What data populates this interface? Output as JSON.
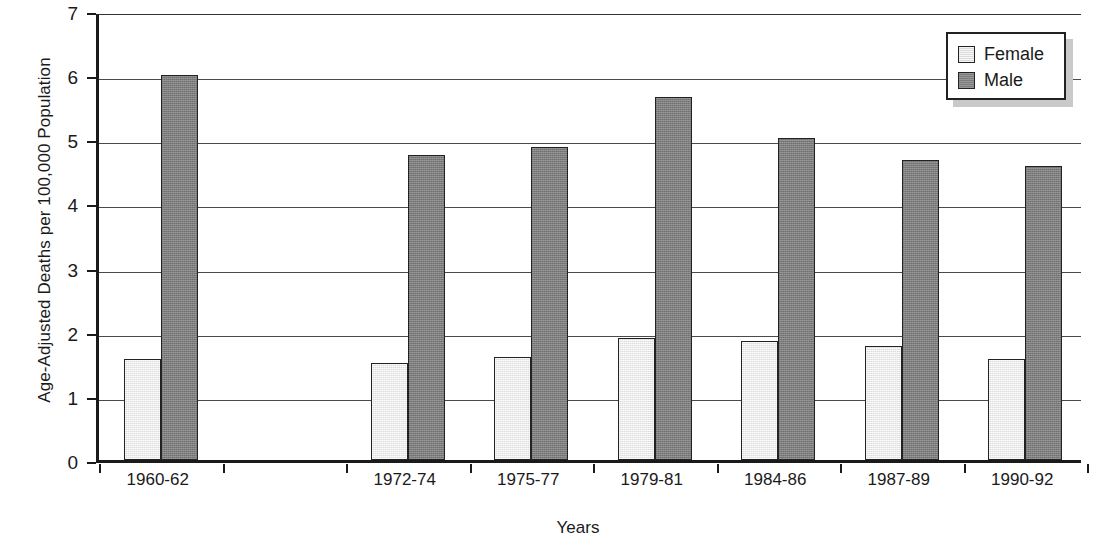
{
  "chart_data": {
    "type": "bar",
    "title": "",
    "xlabel": "Years",
    "ylabel": "Age-Adjusted Deaths per 100,000 Population",
    "categories": [
      "1960-62",
      "1972-74",
      "1975-77",
      "1979-81",
      "1984-86",
      "1987-89",
      "1990-92"
    ],
    "series": [
      {
        "name": "Female",
        "color": "#dcdcdc",
        "values": [
          1.58,
          1.51,
          1.6,
          1.9,
          1.85,
          1.78,
          1.57
        ]
      },
      {
        "name": "Male",
        "color": "#7d7d7d",
        "values": [
          6.0,
          4.76,
          4.88,
          5.66,
          5.02,
          4.67,
          4.58
        ]
      }
    ],
    "ylim": [
      0,
      7
    ],
    "yticks": [
      0,
      1,
      2,
      3,
      4,
      5,
      6,
      7
    ],
    "ytick_labels": [
      "0",
      "1",
      "2",
      "3",
      "4",
      "5",
      "6",
      "7"
    ],
    "grid": true,
    "grid_axis": "y",
    "legend_position": "top-right",
    "legend_entries": [
      "Female",
      "Male"
    ]
  },
  "legend": {
    "items": [
      {
        "label": "Female"
      },
      {
        "label": "Male"
      }
    ]
  },
  "axes": {
    "y_title": "Age-Adjusted Deaths per 100,000 Population",
    "x_title": "Years"
  }
}
